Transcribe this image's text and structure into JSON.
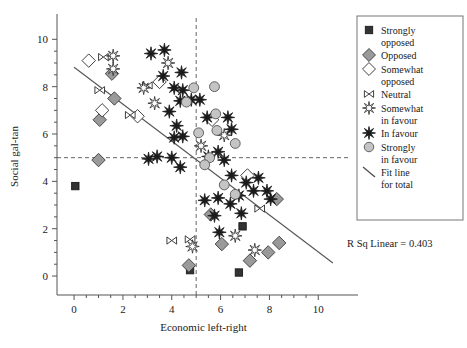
{
  "chart_data": {
    "type": "scatter",
    "title": "",
    "xlabel": "Economic left-right",
    "ylabel": "Social gal-tan",
    "xlim": [
      -0.7,
      11.3
    ],
    "ylim": [
      -0.8,
      10.9
    ],
    "xticks": [
      "0",
      "2",
      "4",
      "6",
      "8",
      "10"
    ],
    "xtick_values": [
      0,
      2,
      4,
      6,
      8,
      10
    ],
    "yticks": [
      "0",
      "2",
      "4",
      "6",
      "8",
      "10"
    ],
    "ytick_values": [
      0,
      2,
      4,
      6,
      8,
      10
    ],
    "grid": false,
    "minor_ticks": true,
    "legend_position": "right",
    "reference_lines": [
      {
        "name": "vertical-reference",
        "orientation": "vertical",
        "value": 5,
        "style": "dashed"
      },
      {
        "name": "horizontal-reference",
        "orientation": "horizontal",
        "value": 5,
        "style": "dashed"
      }
    ],
    "fit_line": {
      "label": "Fit line for total",
      "x0": 0.0,
      "y0": 8.82,
      "x1": 10.6,
      "y1": 0.55,
      "r_squared_label": "R Sq Linear = 0.403",
      "r_squared": 0.403
    },
    "series": [
      {
        "name": "Strongly opposed",
        "marker": "square",
        "fill": "#333333",
        "stroke": "#1a1a1a",
        "points": [
          [
            0.05,
            3.8
          ],
          [
            4.75,
            0.25
          ],
          [
            6.75,
            0.15
          ],
          [
            6.9,
            2.1
          ]
        ]
      },
      {
        "name": "Opposed",
        "marker": "diamond",
        "fill": "#9a9a9a",
        "stroke": "#3a3a3a",
        "points": [
          [
            1.0,
            4.9
          ],
          [
            1.05,
            6.6
          ],
          [
            1.55,
            8.55
          ],
          [
            1.65,
            7.5
          ],
          [
            4.7,
            0.45
          ],
          [
            6.05,
            1.35
          ],
          [
            7.2,
            0.65
          ],
          [
            7.95,
            1.0
          ],
          [
            8.4,
            1.4
          ],
          [
            8.3,
            3.25
          ],
          [
            5.6,
            2.6
          ]
        ]
      },
      {
        "name": "Somewhat opposed",
        "marker": "diamond-open",
        "fill": "#ffffff",
        "stroke": "#2a2a2a",
        "points": [
          [
            0.6,
            9.1
          ],
          [
            1.15,
            7.0
          ],
          [
            2.6,
            6.75
          ],
          [
            3.5,
            8.2
          ],
          [
            5.65,
            6.6
          ],
          [
            7.1,
            4.25
          ]
        ]
      },
      {
        "name": "Neutral",
        "marker": "bowtie",
        "fill": "#ffffff",
        "stroke": "#2a2a2a",
        "points": [
          [
            1.2,
            9.25
          ],
          [
            1.05,
            7.85
          ],
          [
            2.3,
            6.8
          ],
          [
            3.0,
            8.05
          ],
          [
            4.0,
            1.5
          ],
          [
            4.75,
            1.55
          ],
          [
            7.6,
            2.85
          ]
        ]
      },
      {
        "name": "Somewhat in favour",
        "marker": "star8-open",
        "fill": "#ffffff",
        "stroke": "#2a2a2a",
        "points": [
          [
            1.6,
            9.3
          ],
          [
            1.6,
            8.75
          ],
          [
            2.85,
            7.95
          ],
          [
            3.3,
            7.3
          ],
          [
            3.85,
            9.0
          ],
          [
            5.2,
            5.5
          ],
          [
            4.85,
            1.25
          ],
          [
            6.6,
            1.7
          ],
          [
            7.4,
            1.1
          ],
          [
            6.15,
            5.95
          ]
        ]
      },
      {
        "name": "In favour",
        "marker": "star8-filled",
        "fill": "#1a1a1a",
        "stroke": "#1a1a1a",
        "points": [
          [
            3.15,
            9.4
          ],
          [
            3.7,
            9.55
          ],
          [
            3.65,
            8.45
          ],
          [
            4.4,
            8.6
          ],
          [
            4.1,
            7.95
          ],
          [
            4.45,
            7.85
          ],
          [
            4.35,
            7.4
          ],
          [
            4.8,
            7.45
          ],
          [
            5.15,
            7.45
          ],
          [
            3.9,
            6.95
          ],
          [
            4.2,
            6.35
          ],
          [
            4.1,
            5.85
          ],
          [
            4.45,
            5.9
          ],
          [
            4.0,
            5.0
          ],
          [
            3.4,
            5.05
          ],
          [
            4.35,
            4.6
          ],
          [
            5.45,
            6.7
          ],
          [
            5.5,
            5.05
          ],
          [
            5.9,
            5.25
          ],
          [
            6.3,
            6.7
          ],
          [
            6.45,
            6.2
          ],
          [
            6.15,
            4.9
          ],
          [
            6.45,
            4.25
          ],
          [
            7.05,
            3.95
          ],
          [
            7.35,
            3.6
          ],
          [
            7.55,
            4.15
          ],
          [
            6.75,
            3.4
          ],
          [
            6.4,
            3.05
          ],
          [
            5.9,
            3.3
          ],
          [
            5.35,
            3.2
          ],
          [
            5.75,
            2.55
          ],
          [
            6.85,
            2.65
          ],
          [
            5.95,
            1.85
          ],
          [
            7.9,
            3.6
          ],
          [
            8.05,
            3.25
          ],
          [
            3.05,
            4.95
          ]
        ]
      },
      {
        "name": "Strongly in favour",
        "marker": "circle",
        "fill": "#c4c4c4",
        "stroke": "#555555",
        "points": [
          [
            4.9,
            7.95
          ],
          [
            4.6,
            7.35
          ],
          [
            5.75,
            8.0
          ],
          [
            5.8,
            6.85
          ],
          [
            5.85,
            6.15
          ],
          [
            6.6,
            5.6
          ],
          [
            5.55,
            5.0
          ],
          [
            5.35,
            4.7
          ],
          [
            6.15,
            3.85
          ],
          [
            6.6,
            3.45
          ],
          [
            5.1,
            6.05
          ]
        ]
      }
    ]
  },
  "legend": {
    "items": [
      {
        "label": "Strongly opposed",
        "marker": "square"
      },
      {
        "label": "Opposed",
        "marker": "diamond"
      },
      {
        "label": "Somewhat opposed",
        "marker": "diamond-open"
      },
      {
        "label": "Neutral",
        "marker": "bowtie"
      },
      {
        "label": "Somewhat in favour",
        "marker": "star8-open"
      },
      {
        "label": "In favour",
        "marker": "star8-filled"
      },
      {
        "label": "Strongly in favour",
        "marker": "circle"
      },
      {
        "label": "Fit line for total",
        "marker": "line"
      }
    ]
  },
  "colors": {
    "dark": "#333333",
    "grey_fill": "#9a9a9a",
    "circle_fill": "#c4c4c4",
    "axis": "#555555",
    "dashed": "#666666"
  }
}
